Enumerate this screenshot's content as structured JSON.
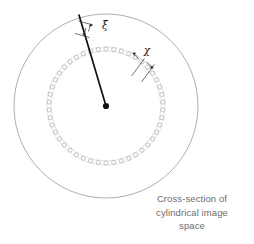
{
  "figure": {
    "name": "cross-section-of-cylindrical-image-space",
    "background_color": "#ffffff"
  },
  "geometry": {
    "center_x": 106,
    "center_y": 106,
    "outer_circle_radius": 92,
    "detector_ring_radius": 57,
    "detector_element_count": 46,
    "detector_element_radius": 2.1,
    "radial_line_outer_x": 79,
    "radial_line_outer_y": 15
  },
  "colors": {
    "outer_circle_stroke": "#9a9a9a",
    "ring_circle_stroke": "#b4b4b4",
    "ring_guide_stroke": "#c8c8c8",
    "radial_line_stroke": "#111111",
    "center_dot_fill": "#111111",
    "annotation_stroke": "#222222",
    "caption_text": "#6d6d6d"
  },
  "annotations": {
    "radial_spacing": {
      "symbol": "ξ",
      "name": "xi",
      "label_x": 105,
      "label_y": 28,
      "meaning": "radial sample spacing"
    },
    "angular_spacing": {
      "symbol": "χ",
      "name": "chi",
      "label_x": 147,
      "label_y": 50,
      "meaning": "angular sample spacing"
    }
  },
  "caption": {
    "lines": [
      "Cross-section of",
      "cylindrical image",
      "space"
    ],
    "line1": "Cross-section of",
    "line2": "cylindrical image",
    "line3": "space"
  }
}
